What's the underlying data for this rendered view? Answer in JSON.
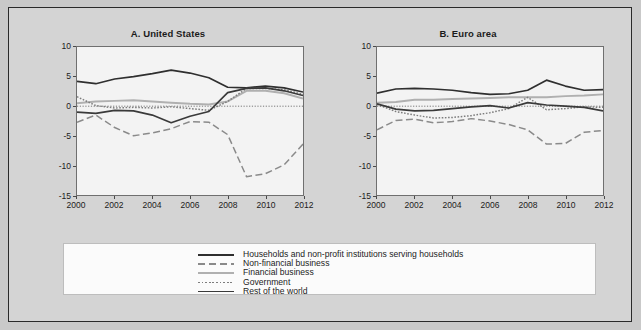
{
  "figure": {
    "background_color": "#d4d4d4",
    "border_color": "#2a2a2a"
  },
  "legend": {
    "entries": [
      {
        "label": "Households and non-profit institutions serving households",
        "style": "solid",
        "color": "#2f2f2f",
        "width": 1.7
      },
      {
        "label": "Non-financial business",
        "style": "long-dash",
        "color": "#8a8a8a",
        "width": 1.5
      },
      {
        "label": "Financial business",
        "style": "solid",
        "color": "#b0b0b0",
        "width": 2.0
      },
      {
        "label": "Government",
        "style": "dotted",
        "color": "#7d7d7d",
        "width": 1.5
      },
      {
        "label": "Rest of the world",
        "style": "solid",
        "color": "#3a3a3a",
        "width": 1.7
      }
    ]
  },
  "chart_data": [
    {
      "type": "line",
      "title": "A. United States",
      "xlabel": "",
      "ylabel": "",
      "xlim": [
        2000,
        2012
      ],
      "ylim": [
        -15,
        10
      ],
      "yticks": [
        10,
        5,
        0,
        -5,
        -10,
        -15
      ],
      "xticks": [
        2000,
        2002,
        2004,
        2006,
        2008,
        2010,
        2012
      ],
      "grid": false,
      "zero_line": true,
      "legend_position": "below-figure",
      "x": [
        2000,
        2001,
        2002,
        2003,
        2004,
        2005,
        2006,
        2007,
        2008,
        2009,
        2010,
        2011,
        2012
      ],
      "series": [
        {
          "name": "Households and non-profit institutions serving households",
          "values": [
            4.2,
            3.8,
            4.6,
            5.0,
            5.5,
            6.1,
            5.6,
            4.8,
            3.2,
            3.1,
            3.4,
            3.1,
            2.4
          ]
        },
        {
          "name": "Non-financial business",
          "values": [
            -2.7,
            -1.5,
            -3.6,
            -5.0,
            -4.5,
            -3.8,
            -2.6,
            -2.7,
            -4.8,
            -11.9,
            -11.4,
            -9.9,
            -6.4
          ]
        },
        {
          "name": "Financial business",
          "values": [
            0.5,
            0.8,
            0.9,
            1.0,
            0.8,
            0.6,
            0.4,
            0.3,
            0.8,
            2.6,
            2.6,
            2.2,
            1.3
          ]
        },
        {
          "name": "Government",
          "values": [
            1.6,
            0.1,
            -0.3,
            -0.2,
            -0.3,
            -0.1,
            -0.4,
            -0.7,
            0.8,
            3.0,
            3.0,
            2.8,
            2.0
          ]
        },
        {
          "name": "Rest of the world",
          "values": [
            -1.0,
            -1.2,
            -0.7,
            -0.8,
            -1.5,
            -2.8,
            -1.7,
            -0.9,
            2.3,
            3.0,
            3.1,
            2.6,
            1.8
          ]
        }
      ]
    },
    {
      "type": "line",
      "title": "B. Euro area",
      "xlabel": "",
      "ylabel": "",
      "xlim": [
        2000,
        2012
      ],
      "ylim": [
        -15,
        10
      ],
      "yticks": [
        10,
        5,
        0,
        -5,
        -10,
        -15
      ],
      "xticks": [
        2000,
        2002,
        2004,
        2006,
        2008,
        2010,
        2012
      ],
      "grid": false,
      "zero_line": true,
      "legend_position": "below-figure",
      "x": [
        2000,
        2001,
        2002,
        2003,
        2004,
        2005,
        2006,
        2007,
        2008,
        2009,
        2010,
        2011,
        2012
      ],
      "series": [
        {
          "name": "Households and non-profit institutions serving households",
          "values": [
            2.2,
            2.9,
            3.0,
            2.9,
            2.7,
            2.3,
            2.0,
            2.1,
            2.7,
            4.4,
            3.4,
            2.7,
            2.8
          ]
        },
        {
          "name": "Non-financial business",
          "values": [
            -4.0,
            -2.4,
            -2.2,
            -2.8,
            -2.6,
            -2.1,
            -2.5,
            -3.1,
            -4.0,
            -6.4,
            -6.3,
            -4.4,
            -4.1
          ]
        },
        {
          "name": "Financial business",
          "values": [
            0.6,
            0.7,
            1.1,
            1.1,
            1.2,
            1.3,
            1.4,
            1.5,
            1.5,
            1.5,
            1.7,
            1.8,
            2.0
          ]
        },
        {
          "name": "Government",
          "values": [
            0.3,
            -0.9,
            -1.5,
            -2.0,
            -1.9,
            -1.6,
            -1.1,
            -0.4,
            1.5,
            -0.6,
            -0.4,
            -0.1,
            -0.2
          ]
        },
        {
          "name": "Rest of the world",
          "values": [
            0.4,
            -0.5,
            -0.8,
            -0.7,
            -0.4,
            -0.1,
            0.1,
            -0.3,
            0.6,
            0.2,
            0.0,
            -0.2,
            -0.8
          ]
        }
      ]
    }
  ]
}
